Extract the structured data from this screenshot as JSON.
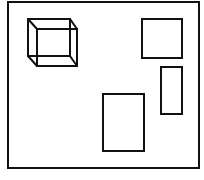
{
  "diagram": {
    "stroke_color": "#111111",
    "background": "#ffffff",
    "frame": {
      "x": 8,
      "y": 2,
      "w": 191,
      "h": 166
    },
    "cube": {
      "front": {
        "x": 28,
        "y": 19,
        "w": 42,
        "h": 37
      },
      "back": {
        "x": 37,
        "y": 29,
        "w": 40,
        "h": 37
      }
    },
    "shapes": [
      {
        "name": "square-top-right",
        "x": 142,
        "y": 19,
        "w": 40,
        "h": 39
      },
      {
        "name": "tall-rectangle-right",
        "x": 161,
        "y": 67,
        "w": 21,
        "h": 47
      },
      {
        "name": "rectangle-bottom-center",
        "x": 103,
        "y": 94,
        "w": 41,
        "h": 57
      }
    ]
  }
}
